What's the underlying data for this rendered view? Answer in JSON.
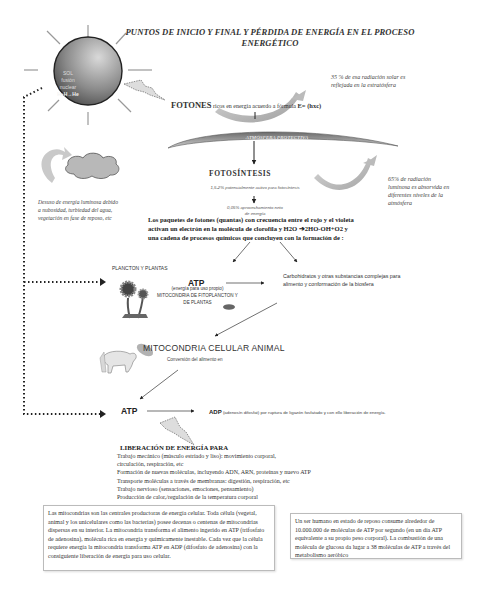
{
  "title": {
    "line1": "PUNTOS DE INICIO  Y FINAL Y PÉRDIDA DE ENERGÍA EN EL PROCESO",
    "line2": "ENERGÉTICO"
  },
  "sun": {
    "line1": "SOL",
    "line2": "fusión",
    "line3": "nuclear",
    "line4": "H+H→He"
  },
  "reflection_note": {
    "line1": "35 % de esa radiación solar es",
    "line2": "reflejada en la estratósfera"
  },
  "fotones": {
    "label": "FOTONES",
    "text": " ricos en energía acuerdo a fórmula ",
    "formula": "E= (hxc)"
  },
  "atmosphere_label": "ATMÓSFERA PROTECTIVA",
  "loss_note": {
    "line1": "Desuso de energía luminosa debido",
    "line2": "a nubosidad, turbiedad del agua,",
    "line3": "vegetación en fase de reposo, etc"
  },
  "absorption_note": {
    "line1": "65% de radiación",
    "line2": "luminosa es absorvida en",
    "line3": "diferentes niveles de la",
    "line4": "atmósfera"
  },
  "fotosintesis": {
    "title": "FOTOSÍNTESIS",
    "sub1": "1,5-2% potencialmente activo para fotosíntesis",
    "sub2_line1": "0,05% aprovechamiento neto",
    "sub2_line2": "de energía"
  },
  "paquetes": {
    "line1": "Los paquetes de fotones (quantas) con crecuencia entre el rojo y el violeta",
    "line2": "activan un electrón en la molécula de clorofila y H2O ➔2HO-OH+O2 y",
    "line3": "una cadena de procesos  químicos que concluyen  con la formación de :"
  },
  "plancton": {
    "label": "PLANCTON Y PLANTAS",
    "atp": "ATP",
    "sub1": "(energía para uso propio)",
    "sub2": "MITOCONDRIA DE FITOPLANCTON  Y",
    "sub3": "DE PLANTAS"
  },
  "carbohidratos": {
    "line1": "Carbohidratos y otras substancias complejas para",
    "line2": "alimento y conformación de la biosfera"
  },
  "mitocondria_animal": {
    "title": "MITOCONDRIA CELULAR  ANIMAL",
    "sub": "Conversión del alimento en"
  },
  "atp_bottom": "ATP",
  "adp": {
    "label": "ADP",
    "text": " (adenosín difosfat) por ruptura de ligazón fosfatado y con ello liberación de energía."
  },
  "liberacion": {
    "title": "LIBERACIÓN DE ENERGÍA  PARA",
    "items": [
      "Trabajo mecánico (músculo estriado y liso): movimiento corporal,",
      " circulación, respiración, etc",
      "Formación de nuevas moléculas, incluyendo ADN, ARN, proteínas y nuevo ATP",
      "Transporte  moléculas a través de membranas: digestión, respiración, etc",
      " Trabajo nervioso (sensaciones, emociones, pensamiento)",
      "Producción de calor,/regulación de la temperatura corporal"
    ]
  },
  "box_left": "Las mitocondrias son las centrales productoras de energía celular. Toda célula (vegetal, animal y los unicelulares como las bacterias) posee decenas o centenas de mitocondrias dispersas en su interior. La mitocondria transforma el alimento ingerido en ATP (trifosfato de adenosina), molécula rica en energía y químicamente inestable. Cada vez que la célula requiere energía  la mitocondria transforma ATP en ADP (difosfato de adenosina) con la consiguiente liberación de energía para uso celular.",
  "box_right": "Un ser humano en estado de  reposo consume alrededor de 10.000.000 de moléculas de ATP por segundo (en un día ATP equivalente a su propio peso corporal). La combustión de una molécula de glucosa da lugar  a 38 moléculas de ATP a través del metabolismo aeróbico"
}
